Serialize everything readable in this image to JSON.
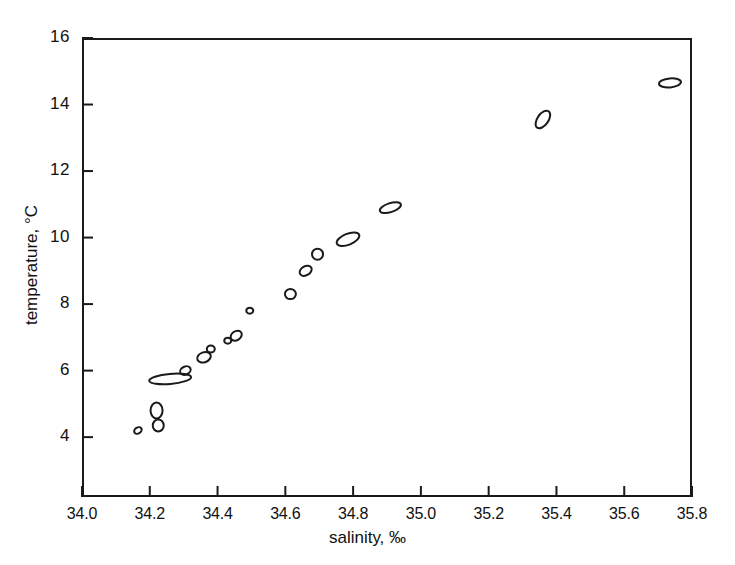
{
  "chart_data": {
    "type": "scatter",
    "title": "",
    "xlabel": "salinity, ‰",
    "ylabel": "temperature, °C",
    "xlim": [
      34.0,
      35.8
    ],
    "ylim": [
      2.2,
      16.0
    ],
    "grid": false,
    "legend": "none",
    "xticks": [
      "34.0",
      "34.2",
      "34.4",
      "34.6",
      "34.8",
      "35.0",
      "35.2",
      "35.4",
      "35.6",
      "35.8"
    ],
    "xtick_values": [
      34.0,
      34.2,
      34.4,
      34.6,
      34.8,
      35.0,
      35.2,
      35.4,
      35.6,
      35.8
    ],
    "yticks": [
      "16",
      "14",
      "12",
      "10",
      "8",
      "6",
      "4"
    ],
    "ytick_values": [
      16,
      14,
      12,
      10,
      8,
      6,
      4
    ],
    "marker_style": "open ellipse",
    "x": [
      34.165,
      34.22,
      34.225,
      34.26,
      34.305,
      34.36,
      34.38,
      34.43,
      34.455,
      34.495,
      34.615,
      34.66,
      34.695,
      34.785,
      34.91,
      35.36,
      35.735
    ],
    "y": [
      4.2,
      4.8,
      4.35,
      5.75,
      6.0,
      6.4,
      6.65,
      6.9,
      7.05,
      7.8,
      8.3,
      9.0,
      9.5,
      9.95,
      10.9,
      13.55,
      14.65
    ],
    "points": [
      {
        "x": 34.165,
        "y": 4.2,
        "rx": 4.0,
        "ry": 3.0,
        "angle": -30
      },
      {
        "x": 34.22,
        "y": 4.8,
        "rx": 6.0,
        "ry": 8.0,
        "angle": 0
      },
      {
        "x": 34.225,
        "y": 4.35,
        "rx": 5.5,
        "ry": 6.0,
        "angle": 0
      },
      {
        "x": 34.26,
        "y": 5.75,
        "rx": 21.0,
        "ry": 5.0,
        "angle": -5
      },
      {
        "x": 34.305,
        "y": 6.0,
        "rx": 5.5,
        "ry": 4.0,
        "angle": -25
      },
      {
        "x": 34.36,
        "y": 6.4,
        "rx": 7.0,
        "ry": 5.0,
        "angle": -20
      },
      {
        "x": 34.38,
        "y": 6.65,
        "rx": 4.0,
        "ry": 3.5,
        "angle": 0
      },
      {
        "x": 34.43,
        "y": 6.9,
        "rx": 3.5,
        "ry": 3.0,
        "angle": 0
      },
      {
        "x": 34.455,
        "y": 7.05,
        "rx": 6.0,
        "ry": 4.5,
        "angle": -35
      },
      {
        "x": 34.495,
        "y": 7.8,
        "rx": 3.5,
        "ry": 3.0,
        "angle": 0
      },
      {
        "x": 34.615,
        "y": 8.3,
        "rx": 5.5,
        "ry": 5.0,
        "angle": 0
      },
      {
        "x": 34.66,
        "y": 9.0,
        "rx": 6.5,
        "ry": 4.5,
        "angle": -30
      },
      {
        "x": 34.695,
        "y": 9.5,
        "rx": 5.5,
        "ry": 5.5,
        "angle": 0
      },
      {
        "x": 34.785,
        "y": 9.95,
        "rx": 12.0,
        "ry": 5.5,
        "angle": -22
      },
      {
        "x": 34.91,
        "y": 10.9,
        "rx": 11.0,
        "ry": 4.5,
        "angle": -18
      },
      {
        "x": 35.36,
        "y": 13.55,
        "rx": 10.0,
        "ry": 5.5,
        "angle": -55
      },
      {
        "x": 35.735,
        "y": 14.65,
        "rx": 11.0,
        "ry": 4.5,
        "angle": -5
      }
    ]
  }
}
